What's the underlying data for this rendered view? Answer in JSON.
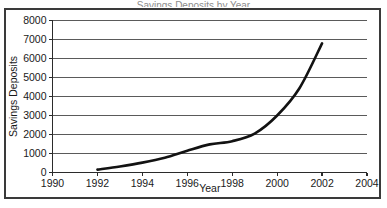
{
  "figure": {
    "frame_color": "#3a3a3a",
    "background": "#ffffff",
    "cropped_title": "Savings Deposits by Year"
  },
  "chart_data": {
    "type": "line",
    "title": "",
    "xlabel": "Year",
    "ylabel": "Savings Deposits",
    "xlim": [
      1990,
      2004
    ],
    "ylim": [
      0,
      8000
    ],
    "xticks": [
      1990,
      1992,
      1994,
      1996,
      1998,
      2000,
      2002,
      2004
    ],
    "xtick_labels": [
      "1990",
      "1992",
      "1994",
      "1996",
      "1998",
      "2000",
      "2002",
      "2004"
    ],
    "yticks": [
      0,
      1000,
      2000,
      3000,
      4000,
      5000,
      6000,
      7000,
      8000
    ],
    "ytick_labels": [
      "0",
      "1000",
      "2000",
      "3000",
      "4000",
      "5000",
      "6000",
      "7000",
      "8000"
    ],
    "grid": "horizontal",
    "legend": "none",
    "series": [
      {
        "name": "Savings Deposits",
        "color": "#121212",
        "x": [
          1992,
          1993,
          1994,
          1995,
          1996,
          1997,
          1998,
          1999,
          2000,
          2001,
          2002
        ],
        "values": [
          150,
          320,
          520,
          780,
          1150,
          1480,
          1650,
          2050,
          3000,
          4450,
          6800
        ]
      }
    ]
  }
}
